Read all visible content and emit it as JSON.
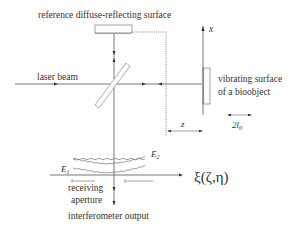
{
  "diagram": {
    "labels": {
      "reference_surface": "reference diffuse-reflecting surface",
      "laser_beam": "laser beam",
      "axis_x": "x",
      "bioobject_line1": "vibrating surface",
      "bioobject_line2": "of a bioobject",
      "distance": "z",
      "amplitude_main": "2l",
      "amplitude_sub": "0",
      "wave1_main": "E",
      "wave1_sub": "1",
      "wave2_main": "E",
      "wave2_sub": "2",
      "plane_coords": "ξ(ζ,η)",
      "aperture_line1": "receiving",
      "aperture_line2": "aperture",
      "output": "interferometer output"
    },
    "colors": {
      "line": "#555555",
      "text": "#333333",
      "background": "#ffffff"
    }
  }
}
